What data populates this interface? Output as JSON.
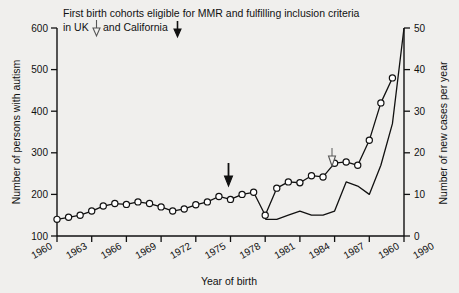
{
  "figure": {
    "caption_line1": "First birth cohorts eligible for MMR and fulfilling inclusion criteria",
    "caption_line2_a": "in UK",
    "caption_line2_b": "and California",
    "uk_arrow_icon": "arrow-down-open-icon",
    "california_arrow_icon": "arrow-down-solid-icon",
    "plot_arrow_uk_icon": "arrow-down-open-icon",
    "plot_arrow_california_icon": "arrow-down-solid-icon",
    "background_color": "#f0efed",
    "ink_color": "#111111",
    "marker_fill_color": "#ffffff"
  },
  "chart_data": {
    "type": "line",
    "title": "First birth cohorts eligible for MMR and fulfilling inclusion criteria in UK and California",
    "xlabel": "Year of birth",
    "ylabel": "Number of persons with autism",
    "y2label": "Number of new cases per year",
    "xlim": [
      1960,
      1990
    ],
    "ylim": [
      100,
      600
    ],
    "y2lim": [
      0,
      50
    ],
    "xticks": [
      1960,
      1963,
      1966,
      1969,
      1972,
      1975,
      1978,
      1981,
      1984,
      1987,
      1990
    ],
    "xticklabels": [
      "1960",
      "1963",
      "1966",
      "1969",
      "1972",
      "1975",
      "1978",
      "1981",
      "1984",
      "1987",
      "1960",
      "1990"
    ],
    "xtick_minor_every": 1,
    "yticks": [
      100,
      200,
      300,
      400,
      500,
      600
    ],
    "yticklabels": [
      "100",
      "200",
      "300",
      "400",
      "500",
      "600"
    ],
    "y2ticks": [
      0,
      10,
      20,
      30,
      40,
      50
    ],
    "y2ticklabels": [
      "0",
      "10",
      "20",
      "30",
      "40",
      "50"
    ],
    "grid": false,
    "legend": "none",
    "annotations": [
      {
        "name": "california-cohort-arrow",
        "x": 1978,
        "y": 250,
        "style": "solid-down-arrow"
      },
      {
        "name": "uk-cohort-arrow",
        "x": 1986,
        "y": 255,
        "style": "open-down-arrow"
      }
    ],
    "series": [
      {
        "name": "Number of persons with autism",
        "axis": "left",
        "marker": "open-circle",
        "x": [
          1960,
          1961,
          1962,
          1963,
          1964,
          1965,
          1966,
          1967,
          1968,
          1969,
          1970,
          1971,
          1972,
          1973,
          1974,
          1975,
          1976,
          1977,
          1978,
          1979,
          1980,
          1981,
          1982,
          1983,
          1984,
          1985,
          1986,
          1987,
          1988,
          1989
        ],
        "values": [
          140,
          145,
          150,
          160,
          172,
          178,
          176,
          182,
          178,
          170,
          160,
          165,
          175,
          182,
          195,
          188,
          200,
          205,
          150,
          215,
          230,
          228,
          245,
          242,
          275,
          278,
          270,
          330,
          420,
          480
        ]
      },
      {
        "name": "Number of new cases per year",
        "axis": "right",
        "marker": "none",
        "x": [
          1978,
          1979,
          1980,
          1981,
          1982,
          1983,
          1984,
          1985,
          1986,
          1987,
          1988,
          1989,
          1990
        ],
        "values": [
          4,
          4,
          5,
          6,
          5,
          5,
          6,
          13,
          12,
          10,
          17,
          27,
          50
        ]
      }
    ]
  }
}
